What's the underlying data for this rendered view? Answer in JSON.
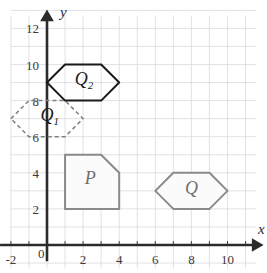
{
  "figure": {
    "title": "",
    "background_color": "#ffffff",
    "grid_color": "#d9d9e0",
    "axis_color": "#2b2b2b"
  },
  "axes": {
    "x_axis_label": "x",
    "y_axis_label": "y",
    "origin_label": "0",
    "x_ticks": [
      "-2",
      "2",
      "4",
      "6",
      "8",
      "10"
    ],
    "x_tick_values": [
      -2,
      2,
      4,
      6,
      8,
      10
    ],
    "y_ticks": [
      "2",
      "4",
      "6",
      "8",
      "10",
      "12"
    ],
    "y_tick_values": [
      2,
      4,
      6,
      8,
      10,
      12
    ],
    "xlim": [
      -2,
      11.5
    ],
    "ylim": [
      -1.5,
      12.8
    ],
    "grid": true,
    "grid_step": 1
  },
  "chart_data": {
    "type": "scatter",
    "title": "",
    "xlabel": "x",
    "ylabel": "y",
    "xlim": [
      -2,
      11.5
    ],
    "ylim": [
      -1.5,
      12.8
    ],
    "grid": true,
    "legend": "none",
    "shapes": [
      {
        "name": "P",
        "label": "P",
        "kind": "pentagon",
        "stroke": "#8a8a8a",
        "stroke_width": 2,
        "dash": "none",
        "fill": "#fbfbfb",
        "label_x": 2.4,
        "label_y": 3.4,
        "vertices": [
          [
            1,
            2
          ],
          [
            1,
            5
          ],
          [
            3,
            5
          ],
          [
            4,
            4
          ],
          [
            4,
            2
          ]
        ]
      },
      {
        "name": "Q",
        "label": "Q",
        "kind": "hexagon",
        "stroke": "#8a8a8a",
        "stroke_width": 2,
        "dash": "none",
        "fill": "#fbfbfb",
        "label_x": 8.0,
        "label_y": 2.85,
        "vertices": [
          [
            6,
            3
          ],
          [
            7,
            4
          ],
          [
            9,
            4
          ],
          [
            10,
            3
          ],
          [
            9,
            2
          ],
          [
            7,
            2
          ]
        ]
      },
      {
        "name": "Q1",
        "label": "Q",
        "sublabel": "1",
        "kind": "hexagon",
        "stroke": "#808080",
        "stroke_width": 1.5,
        "dash": "4,3",
        "fill": "none",
        "label_x": 0.15,
        "label_y": 6.85,
        "vertices": [
          [
            -2,
            7
          ],
          [
            -1,
            8
          ],
          [
            1,
            8
          ],
          [
            2,
            7
          ],
          [
            1,
            6
          ],
          [
            -1,
            6
          ]
        ]
      },
      {
        "name": "Q2",
        "label": "Q",
        "sublabel": "2",
        "kind": "hexagon",
        "stroke": "#1a1a1a",
        "stroke_width": 2,
        "dash": "none",
        "fill": "none",
        "label_x": 2.05,
        "label_y": 8.85,
        "vertices": [
          [
            0,
            9
          ],
          [
            1,
            10
          ],
          [
            3,
            10
          ],
          [
            4,
            9
          ],
          [
            3,
            8
          ],
          [
            1,
            8
          ]
        ]
      }
    ]
  }
}
